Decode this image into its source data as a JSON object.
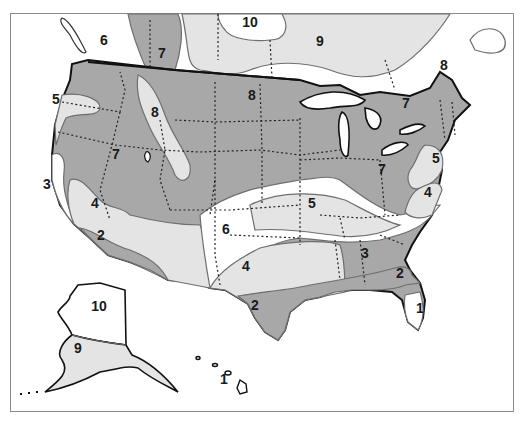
{
  "map": {
    "type": "zone map",
    "region": "United States with Alaska and Hawaii",
    "colors": {
      "dark_zone": "#a8a8a8",
      "light_zone": "#e4e4e4",
      "white_zone": "#ffffff",
      "outline": "#111111",
      "zone_boundary": "#6e6e6e",
      "frame": "#8a8a8a"
    },
    "labels": [
      {
        "id": "z10-canada",
        "text": "10",
        "x": 250,
        "y": 27
      },
      {
        "id": "z6-bc",
        "text": "6",
        "x": 104,
        "y": 45
      },
      {
        "id": "z7-rockies-canada",
        "text": "7",
        "x": 162,
        "y": 58
      },
      {
        "id": "z9-canada",
        "text": "9",
        "x": 320,
        "y": 46
      },
      {
        "id": "z8-quebec",
        "text": "8",
        "x": 444,
        "y": 70
      },
      {
        "id": "z8-north-plains",
        "text": "8",
        "x": 252,
        "y": 100
      },
      {
        "id": "z7-great-lakes",
        "text": "7",
        "x": 406,
        "y": 108
      },
      {
        "id": "z5-pacific-nw",
        "text": "5",
        "x": 56,
        "y": 104
      },
      {
        "id": "z8-rockies",
        "text": "8",
        "x": 155,
        "y": 117
      },
      {
        "id": "z7-west",
        "text": "7",
        "x": 116,
        "y": 159
      },
      {
        "id": "z5-mid-atlantic",
        "text": "5",
        "x": 436,
        "y": 163
      },
      {
        "id": "z7-midwest",
        "text": "7",
        "x": 382,
        "y": 174
      },
      {
        "id": "z3-california",
        "text": "3",
        "x": 47,
        "y": 189
      },
      {
        "id": "z4-virginia",
        "text": "4",
        "x": 428,
        "y": 197
      },
      {
        "id": "z5-central",
        "text": "5",
        "x": 312,
        "y": 208
      },
      {
        "id": "z4-nevada",
        "text": "4",
        "x": 95,
        "y": 208
      },
      {
        "id": "z6-new-mexico",
        "text": "6",
        "x": 226,
        "y": 234
      },
      {
        "id": "z2-socal",
        "text": "2",
        "x": 101,
        "y": 240
      },
      {
        "id": "z3-southeast",
        "text": "3",
        "x": 365,
        "y": 258
      },
      {
        "id": "z4-texas",
        "text": "4",
        "x": 246,
        "y": 271
      },
      {
        "id": "z2-gulf-east",
        "text": "2",
        "x": 400,
        "y": 278
      },
      {
        "id": "z10-alaska",
        "text": "10",
        "x": 99,
        "y": 311
      },
      {
        "id": "z2-gulf-texas",
        "text": "2",
        "x": 255,
        "y": 310
      },
      {
        "id": "z1-florida",
        "text": "1",
        "x": 420,
        "y": 313
      },
      {
        "id": "z9-alaska",
        "text": "9",
        "x": 78,
        "y": 353
      },
      {
        "id": "z1-hawaii",
        "text": "1",
        "x": 224,
        "y": 384
      }
    ]
  }
}
